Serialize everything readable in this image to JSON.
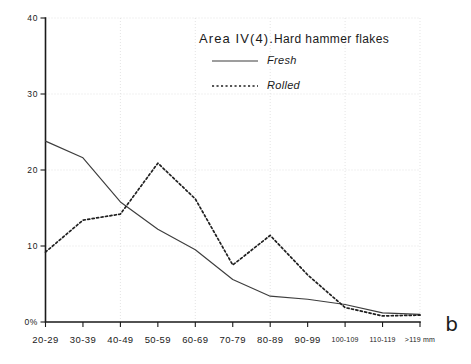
{
  "figure": {
    "panel_letter": "b",
    "title_area": "Area IV(4).",
    "title_rest": "Hard hammer flakes"
  },
  "chart_data": {
    "type": "line",
    "title": "Area IV(4).Hard hammer flakes",
    "xlabel": "",
    "ylabel": "",
    "grid": true,
    "legend_position": "top-center",
    "ylim": [
      0,
      40
    ],
    "ytick_labels": [
      "0%",
      "10",
      "20",
      "30",
      "40"
    ],
    "ytick_values": [
      0,
      10,
      20,
      30,
      40
    ],
    "categories": [
      "20-29",
      "30-39",
      "40-49",
      "50-59",
      "60-69",
      "70-79",
      "80-89",
      "90-99",
      "100-109",
      "110-119",
      ">119 mm"
    ],
    "series": [
      {
        "name": "Fresh",
        "style": "solid",
        "values": [
          23.8,
          21.6,
          15.8,
          12.2,
          9.5,
          5.6,
          3.4,
          3.0,
          2.3,
          1.2,
          1.0
        ]
      },
      {
        "name": "Rolled",
        "style": "dotted",
        "values": [
          9.2,
          13.4,
          14.2,
          20.9,
          16.2,
          7.5,
          11.4,
          6.2,
          1.9,
          0.8,
          0.9
        ]
      }
    ]
  },
  "axes": {
    "y_ticks": [
      {
        "label": "40",
        "value": 40
      },
      {
        "label": "30",
        "value": 30
      },
      {
        "label": "20",
        "value": 20
      },
      {
        "label": "10",
        "value": 10
      },
      {
        "label": "0%",
        "value": 0
      }
    ],
    "x_ticks": [
      {
        "label": "20-29",
        "small": false
      },
      {
        "label": "30-39",
        "small": false
      },
      {
        "label": "40-49",
        "small": false
      },
      {
        "label": "50-59",
        "small": false
      },
      {
        "label": "60-69",
        "small": false
      },
      {
        "label": "70-79",
        "small": false
      },
      {
        "label": "80-89",
        "small": false
      },
      {
        "label": "90-99",
        "small": false
      },
      {
        "label": "100-109",
        "small": true
      },
      {
        "label": "110-119",
        "small": true
      },
      {
        "label": ">119 mm",
        "small": true
      }
    ]
  },
  "legend": {
    "entries": [
      {
        "label": "Fresh",
        "style": "solid"
      },
      {
        "label": "Rolled",
        "style": "dotted"
      }
    ]
  }
}
